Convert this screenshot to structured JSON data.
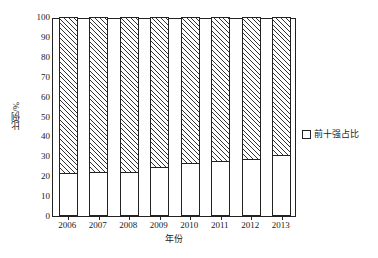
{
  "chart_data": {
    "type": "bar",
    "stacked": true,
    "title": "",
    "subtitle": "",
    "xlabel": "年份",
    "ylabel": "比例/%",
    "categories": [
      "2006",
      "2007",
      "2008",
      "2009",
      "2010",
      "2011",
      "2012",
      "2013"
    ],
    "series": [
      {
        "name": "前十强占比",
        "fill": "white",
        "values": [
          21.6,
          22.3,
          21.9,
          24.5,
          26.5,
          27.5,
          28.6,
          30.5
        ]
      },
      {
        "name": "其余占比",
        "fill": "hatched",
        "values": [
          78.4,
          77.7,
          78.1,
          75.5,
          73.5,
          72.5,
          71.4,
          69.5
        ]
      }
    ],
    "ylim": [
      0,
      100
    ],
    "yticks": [
      0,
      10,
      20,
      30,
      40,
      50,
      60,
      70,
      80,
      90,
      100
    ],
    "ytick_labels": [
      "0",
      "10",
      "20",
      "30",
      "40",
      "50",
      "60",
      "70",
      "80",
      "90",
      "100"
    ],
    "grid": false,
    "legend": {
      "position": "right",
      "entries": [
        {
          "label": "前十强占比",
          "swatch": "white-square"
        }
      ]
    },
    "colors": {
      "axis": "#222222",
      "bar_outline": "#222222",
      "bar_fill_bottom": "#ffffff",
      "hatch_line": "#333333",
      "background": "#ffffff"
    }
  }
}
